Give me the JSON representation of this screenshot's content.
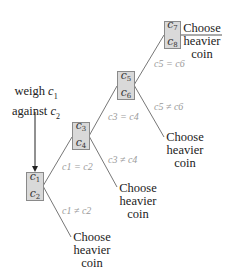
{
  "start_label": {
    "line1": "weigh",
    "line1_var": "c1",
    "line2": "against",
    "line2_var": "c2"
  },
  "nodes": [
    {
      "id": "n1",
      "top": "c1",
      "bottom": "c2"
    },
    {
      "id": "n2",
      "top": "c3",
      "bottom": "c4"
    },
    {
      "id": "n3",
      "top": "c5",
      "bottom": "c6"
    },
    {
      "id": "n4",
      "top": "c7",
      "bottom": "c8"
    }
  ],
  "edges": [
    {
      "from": "n1",
      "to": "n2",
      "label": "c1 = c2"
    },
    {
      "from": "n1",
      "to": "leaf1",
      "label": "c1 ≠ c2"
    },
    {
      "from": "n2",
      "to": "n3",
      "label": "c3 = c4"
    },
    {
      "from": "n2",
      "to": "leaf2",
      "label": "c3 ≠ c4"
    },
    {
      "from": "n3",
      "to": "n4",
      "label": "c5 = c6"
    },
    {
      "from": "n3",
      "to": "leaf3",
      "label": "c5 ≠ c6"
    }
  ],
  "leaves": [
    {
      "id": "leaf1",
      "line1": "Choose",
      "line2": "heavier",
      "line3": "coin"
    },
    {
      "id": "leaf2",
      "line1": "Choose",
      "line2": "heavier",
      "line3": "coin"
    },
    {
      "id": "leaf3",
      "line1": "Choose",
      "line2": "heavier",
      "line3": "coin"
    },
    {
      "id": "leaf4",
      "line1": "Choose",
      "line2": "heavier",
      "line3": "coin"
    }
  ],
  "colors": {
    "box_fill": "#d9d9d9",
    "box_border": "#8a8a8a",
    "line": "#777777",
    "condition_text": "#9a9a9a"
  }
}
